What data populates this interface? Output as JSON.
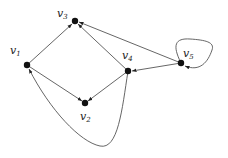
{
  "diagram": {
    "type": "directed-graph",
    "nodes": [
      {
        "id": "v1",
        "label": "v",
        "sub": "1",
        "x": 27,
        "y": 65,
        "lx": 10,
        "ly": 54
      },
      {
        "id": "v2",
        "label": "v",
        "sub": "2",
        "x": 85,
        "y": 103,
        "lx": 80,
        "ly": 120
      },
      {
        "id": "v3",
        "label": "v",
        "sub": "3",
        "x": 75,
        "y": 21,
        "lx": 57,
        "ly": 17
      },
      {
        "id": "v4",
        "label": "v",
        "sub": "4",
        "x": 128,
        "y": 71,
        "lx": 122,
        "ly": 59
      },
      {
        "id": "v5",
        "label": "v",
        "sub": "5",
        "x": 181,
        "y": 63,
        "lx": 183,
        "ly": 57
      }
    ],
    "edges": [
      {
        "from": "v1",
        "to": "v3"
      },
      {
        "from": "v1",
        "to": "v2"
      },
      {
        "from": "v4",
        "to": "v3"
      },
      {
        "from": "v4",
        "to": "v2"
      },
      {
        "from": "v5",
        "to": "v3"
      },
      {
        "from": "v5",
        "to": "v4"
      },
      {
        "from": "v5",
        "to": "v5",
        "kind": "self-loop"
      },
      {
        "from": "v4",
        "to": "v1",
        "kind": "curved"
      }
    ]
  }
}
